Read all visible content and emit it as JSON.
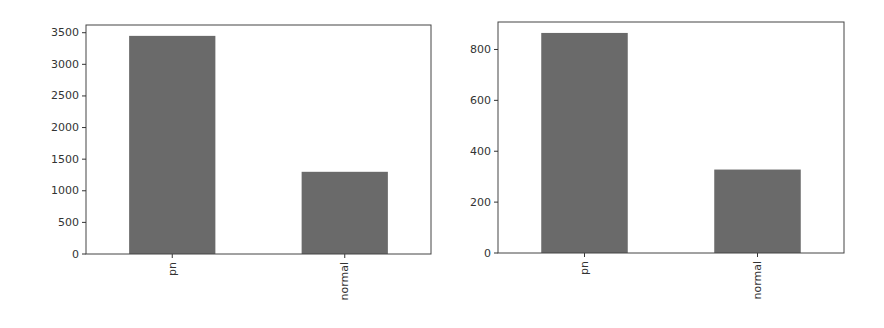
{
  "chart_data": [
    {
      "type": "bar",
      "title": "",
      "xlabel": "",
      "ylabel": "",
      "categories": [
        "pn",
        "normal"
      ],
      "values": [
        3450,
        1300
      ],
      "ylim": [
        0,
        3622
      ],
      "yticks": [
        0,
        500,
        1000,
        1500,
        2000,
        2500,
        3000,
        3500
      ],
      "ytick_labels": [
        "0",
        "500",
        "1000",
        "1500",
        "2000",
        "2500",
        "3000",
        "3500"
      ],
      "xtick_rotation": 90,
      "bar_color": "#6a6a6a",
      "grid": false,
      "legend": null
    },
    {
      "type": "bar",
      "title": "",
      "xlabel": "",
      "ylabel": "",
      "categories": [
        "pn",
        "normal"
      ],
      "values": [
        865,
        328
      ],
      "ylim": [
        0,
        908
      ],
      "yticks": [
        0,
        200,
        400,
        600,
        800
      ],
      "ytick_labels": [
        "0",
        "200",
        "400",
        "600",
        "800"
      ],
      "xtick_rotation": 90,
      "bar_color": "#6a6a6a",
      "grid": false,
      "legend": null
    }
  ],
  "layout": [
    {
      "left": 86,
      "top": 25,
      "width": 345,
      "height": 229
    },
    {
      "left": 498,
      "top": 22,
      "width": 346,
      "height": 231
    }
  ]
}
